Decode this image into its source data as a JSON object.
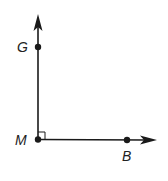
{
  "diagram": {
    "type": "geometry-right-angle",
    "colors": {
      "stroke": "#1a1a1a",
      "point": "#1a1a1a",
      "label": "#222222",
      "background": "#ffffff"
    },
    "vertex": {
      "label": "M",
      "x": 38,
      "y": 139
    },
    "points": [
      {
        "label": "G",
        "x": 38,
        "y": 47
      },
      {
        "label": "M",
        "x": 38,
        "y": 139
      },
      {
        "label": "B",
        "x": 127,
        "y": 140
      }
    ],
    "rays": [
      {
        "name": "ray-MG",
        "from": "M",
        "through": "G",
        "direction": "up"
      },
      {
        "name": "ray-MB",
        "from": "M",
        "through": "B",
        "direction": "right"
      }
    ],
    "right_angle_marker": {
      "at": "M",
      "size": 7
    },
    "labels": {
      "G": "G",
      "M": "M",
      "B": "B"
    }
  }
}
